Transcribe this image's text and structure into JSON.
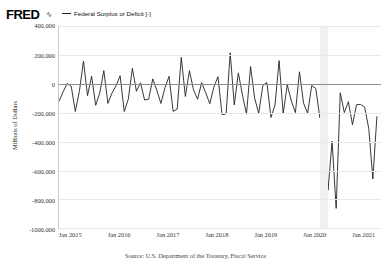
{
  "header": {
    "logo_text": "FRED",
    "logo_mark": "icon",
    "legend": {
      "label": "Federal Surplus or Deficit [-]",
      "color": "#222222"
    }
  },
  "axes": {
    "ylabel": "Millions of Dollars",
    "yticks": [
      "400,000",
      "200,000",
      "0",
      "-200,000",
      "-400,000",
      "-600,000",
      "-800,000",
      "-1000,000"
    ],
    "xticks": [
      "Jan 2015",
      "Jan 2016",
      "Jan 2017",
      "Jan 2018",
      "Jan 2019",
      "Jan 2020",
      "Jan 2021"
    ]
  },
  "footer": {
    "source": "Source: U.S. Department of the Treasury, Fiscal Service"
  },
  "chart_data": {
    "type": "line",
    "title": "",
    "subtitle": "",
    "xlabel": "",
    "ylabel": "Millions of Dollars",
    "ylim": [
      -1000000,
      400000
    ],
    "ytick_values": [
      400000,
      200000,
      0,
      -200000,
      -400000,
      -600000,
      -800000,
      -1000000
    ],
    "xlim": [
      "2014-10",
      "2021-05"
    ],
    "xtick_labels": [
      "Jan 2015",
      "Jan 2016",
      "Jan 2017",
      "Jan 2018",
      "Jan 2019",
      "Jan 2020",
      "Jan 2021"
    ],
    "grid": true,
    "legend_position": "top",
    "zero_reference_line": 0,
    "units": "Millions of Dollars",
    "frequency": "Monthly",
    "series": [
      {
        "name": "Federal Surplus or Deficit [-]",
        "color": "#222222",
        "x": [
          "2014-10",
          "2014-11",
          "2014-12",
          "2015-01",
          "2015-02",
          "2015-03",
          "2015-04",
          "2015-05",
          "2015-06",
          "2015-07",
          "2015-08",
          "2015-09",
          "2015-10",
          "2015-11",
          "2015-12",
          "2016-01",
          "2016-02",
          "2016-03",
          "2016-04",
          "2016-05",
          "2016-06",
          "2016-07",
          "2016-08",
          "2016-09",
          "2016-10",
          "2016-11",
          "2016-12",
          "2017-01",
          "2017-02",
          "2017-03",
          "2017-04",
          "2017-05",
          "2017-06",
          "2017-07",
          "2017-08",
          "2017-09",
          "2017-10",
          "2017-11",
          "2017-12",
          "2018-01",
          "2018-02",
          "2018-03",
          "2018-04",
          "2018-05",
          "2018-06",
          "2018-07",
          "2018-08",
          "2018-09",
          "2018-10",
          "2018-11",
          "2018-12",
          "2019-01",
          "2019-02",
          "2019-03",
          "2019-04",
          "2019-05",
          "2019-06",
          "2019-07",
          "2019-08",
          "2019-09",
          "2019-10",
          "2019-11",
          "2019-12",
          "2020-01",
          "2020-02",
          "2020-03",
          "2020-04",
          "2020-05",
          "2020-06",
          "2020-07",
          "2020-08",
          "2020-09",
          "2020-10",
          "2020-11",
          "2020-12",
          "2021-01",
          "2021-02",
          "2021-03",
          "2021-04"
        ],
        "values": [
          -121700,
          -56800,
          1900,
          -17500,
          -192300,
          -52900,
          156700,
          -82400,
          51800,
          -149200,
          -64400,
          91100,
          -136500,
          -64600,
          -14400,
          55200,
          -192600,
          -108000,
          106500,
          -52500,
          6300,
          -112800,
          -107100,
          33400,
          -45800,
          -136700,
          -27500,
          51300,
          -192000,
          -176200,
          182400,
          -88400,
          90200,
          -42900,
          -107700,
          7900,
          -63200,
          -138500,
          -23200,
          49200,
          -215200,
          -208700,
          214300,
          -146800,
          74900,
          -76900,
          -211300,
          119100,
          -100500,
          -204900,
          -13500,
          8700,
          -234000,
          -147000,
          160300,
          -207800,
          -8500,
          -119700,
          -200300,
          82800,
          -134500,
          -205600,
          -13300,
          -32600,
          -235300,
          -119100,
          -737900,
          -398800,
          -864100,
          -63000,
          -200100,
          -124600,
          -284100,
          -145300,
          -143600,
          -162800,
          -310900,
          -660000,
          -225600
        ]
      }
    ],
    "annotations": [
      {
        "type": "recession_band",
        "start": "2020-02",
        "end": "2020-04",
        "color": "#eef0f3"
      }
    ]
  }
}
